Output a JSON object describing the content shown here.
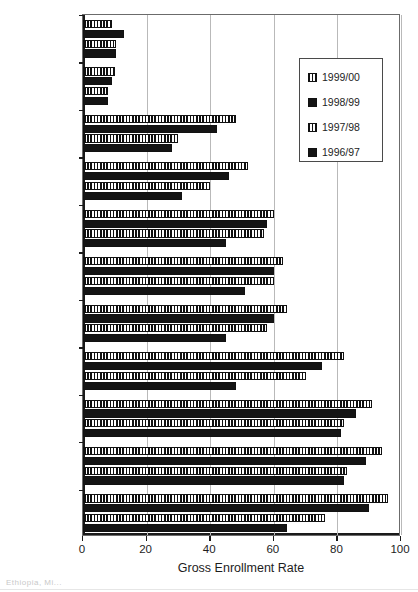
{
  "chart_data": {
    "type": "bar",
    "orientation": "horizontal",
    "title": "",
    "xlabel": "Gross Enrollment Rate",
    "ylabel": "",
    "xlim": [
      0,
      100
    ],
    "xticks": [
      0,
      20,
      40,
      60,
      80,
      100
    ],
    "xtick_labels": [
      "0",
      "20",
      "40",
      "60",
      "80",
      "100"
    ],
    "grid": true,
    "grid_axis": "x",
    "legend_position": "upper right",
    "categories": [
      "Somali",
      "Afar",
      "Amhara",
      "Oromiya",
      "SNNPR",
      "Dire Dawa",
      "Tigray",
      "Benishangul",
      "Addis Ababa",
      "Gambella",
      "Harari"
    ],
    "series": [
      {
        "name": "1999/00",
        "fill": "striped",
        "values": [
          9,
          10,
          48,
          52,
          60,
          63,
          64,
          82,
          91,
          94,
          96
        ]
      },
      {
        "name": "1998/99",
        "fill": "solid",
        "values": [
          13,
          9,
          42,
          46,
          58,
          60,
          60,
          75,
          86,
          89,
          90
        ]
      },
      {
        "name": "1997/98",
        "fill": "striped",
        "values": [
          10.5,
          8,
          30,
          40,
          57,
          60,
          58,
          70,
          82,
          83,
          76
        ]
      },
      {
        "name": "1996/97",
        "fill": "solid",
        "values": [
          10.5,
          8,
          28,
          31,
          45,
          51,
          45,
          48,
          81,
          82,
          64
        ]
      }
    ]
  },
  "legend": {
    "items": [
      {
        "label": "1999/00",
        "fill": "striped"
      },
      {
        "label": "1998/99",
        "fill": "solid"
      },
      {
        "label": "1997/98",
        "fill": "striped"
      },
      {
        "label": "1996/97",
        "fill": "solid"
      }
    ]
  },
  "artifacts": {
    "caption": "Ethiopia, Mi..."
  },
  "colors": {
    "bar_dark": "#141414",
    "axis": "#1a1a1a",
    "grid": "#b9b9b9",
    "background": "#ffffff"
  }
}
